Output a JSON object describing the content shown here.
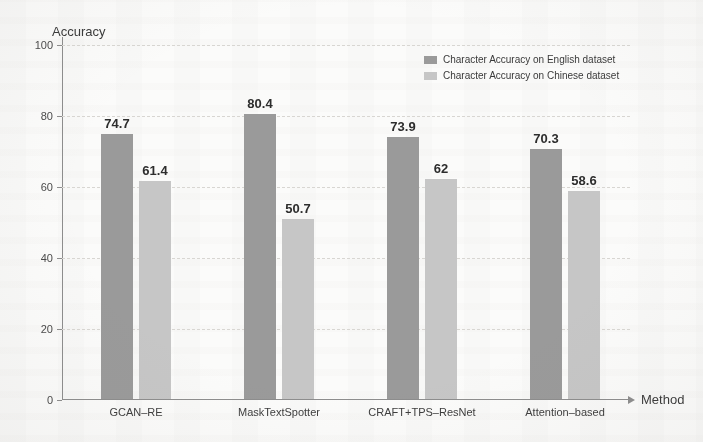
{
  "chart_data": {
    "type": "bar",
    "title": "",
    "xlabel": "Method",
    "ylabel": "Accuracy",
    "ylim": [
      0,
      100
    ],
    "yticks": [
      0,
      20,
      40,
      60,
      80,
      100
    ],
    "ytick_labels": [
      "0",
      "20",
      "40",
      "60",
      "80",
      "100"
    ],
    "grid": "horizontal-dashed",
    "legend_position": "top-right-inside",
    "categories": [
      "GCAN–RE",
      "MaskTextSpotter",
      "CRAFT+TPS–ResNet",
      "Attention–based"
    ],
    "series": [
      {
        "name": "Character Accuracy on English dataset",
        "color": "#9a9a9a",
        "values": [
          74.7,
          80.4,
          73.9,
          70.3
        ],
        "value_labels": [
          "74.7",
          "80.4",
          "73.9",
          "70.3"
        ]
      },
      {
        "name": "Character Accuracy on Chinese dataset",
        "color": "#c6c6c6",
        "values": [
          61.4,
          50.7,
          62,
          58.6
        ],
        "value_labels": [
          "61.4",
          "50.7",
          "62",
          "58.6"
        ]
      }
    ]
  },
  "figure": {
    "background_color": "#fbfbfa",
    "axis_color": "#8d8d8d",
    "gridline_color": "#d8d6d2"
  }
}
